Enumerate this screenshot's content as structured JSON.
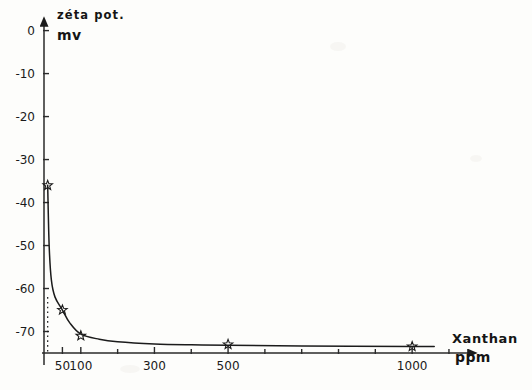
{
  "chart_data": {
    "type": "line",
    "title": "",
    "subtitle": "",
    "ylabel": "zéta pot.",
    "yunit": "mv",
    "xlabel": "Xanthan",
    "xunit": "ppm",
    "grid": false,
    "legend": "none",
    "xlim": [
      0,
      1130
    ],
    "ylim": [
      -75,
      2
    ],
    "x_ticks_major": [
      50,
      100,
      300,
      500,
      1000
    ],
    "x_tick_labels": [
      "50",
      "100",
      "300",
      "500",
      "1000"
    ],
    "x_ticks_minor": [
      200,
      400,
      600,
      700,
      800,
      900,
      1100
    ],
    "y_ticks": [
      0,
      -10,
      -20,
      -30,
      -40,
      -50,
      -60,
      -70
    ],
    "y_tick_labels": [
      "0",
      "-10",
      "-20",
      "-30",
      "-40",
      "-50",
      "-60",
      "-70"
    ],
    "marker": "star-open",
    "series": [
      {
        "name": "zeta potential",
        "x": [
          10,
          50,
          100,
          500,
          1000
        ],
        "values": [
          -36,
          -65,
          -71,
          -73,
          -73.5
        ]
      }
    ],
    "annotations": [
      {
        "name": "dotted-dropline",
        "x": 10,
        "from_y": -62,
        "to_y": -75,
        "style": "dotted"
      }
    ],
    "curve_points": [
      {
        "x": 10,
        "y": -36
      },
      {
        "x": 14,
        "y": -50
      },
      {
        "x": 20,
        "y": -58
      },
      {
        "x": 30,
        "y": -62
      },
      {
        "x": 50,
        "y": -65
      },
      {
        "x": 70,
        "y": -68
      },
      {
        "x": 100,
        "y": -70.6
      },
      {
        "x": 150,
        "y": -71.8
      },
      {
        "x": 200,
        "y": -72.4
      },
      {
        "x": 300,
        "y": -72.9
      },
      {
        "x": 400,
        "y": -73.1
      },
      {
        "x": 500,
        "y": -73.2
      },
      {
        "x": 700,
        "y": -73.4
      },
      {
        "x": 1000,
        "y": -73.5
      },
      {
        "x": 1060,
        "y": -73.5
      }
    ],
    "colors": {
      "curve": "#1b1b1b",
      "axis": "#2a2a2a",
      "text": "#151515",
      "background": "#fdfdfb"
    }
  }
}
